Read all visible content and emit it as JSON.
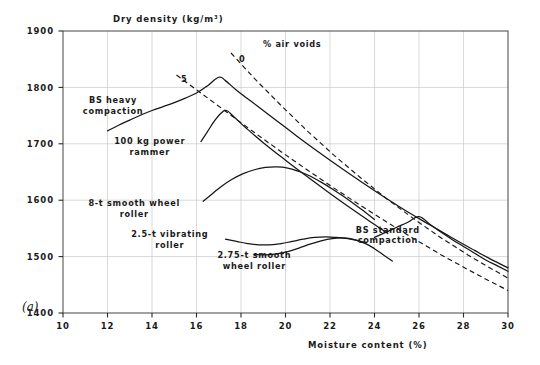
{
  "chart_data": {
    "type": "line",
    "title": "Dry density (kg/m³)",
    "panel_label": "(a)",
    "xlabel": "Moisture content (%)",
    "ylabel": "Dry density (kg/m³)",
    "xlim": [
      10,
      30
    ],
    "ylim": [
      1400,
      1900
    ],
    "xticks": [
      10,
      12,
      14,
      16,
      18,
      20,
      22,
      24,
      26,
      28,
      30
    ],
    "xtick_labels": [
      "10",
      "12",
      "14",
      "16",
      "18",
      "20",
      "22",
      "24",
      "26",
      "28",
      "30"
    ],
    "yticks": [
      1400,
      1500,
      1600,
      1700,
      1800,
      1900
    ],
    "ytick_labels": [
      "1400",
      "1500",
      "1600",
      "1700",
      "1800",
      "1900"
    ],
    "grid": true,
    "legend_position": "inline-annotations",
    "annotations": [
      {
        "name": "air-voids-title",
        "text": "% air voids",
        "x": 20.3,
        "y": 1872
      },
      {
        "name": "air-voids-0",
        "text": "0",
        "x": 18.05,
        "y": 1845
      },
      {
        "name": "air-voids-5",
        "text": "5",
        "x": 15.45,
        "y": 1810
      }
    ],
    "series": [
      {
        "name": "BS heavy compaction",
        "label": "BS heavy\ncompaction",
        "label_lines": [
          "BS heavy",
          "compaction"
        ],
        "label_x": 12.25,
        "label_y": 1772,
        "style": "solid",
        "points": [
          [
            12.0,
            1723
          ],
          [
            12.5,
            1733
          ],
          [
            13.0,
            1742
          ],
          [
            13.5,
            1751
          ],
          [
            14.0,
            1759
          ],
          [
            14.5,
            1766
          ],
          [
            15.0,
            1773
          ],
          [
            15.5,
            1781
          ],
          [
            16.0,
            1790
          ],
          [
            16.5,
            1803
          ],
          [
            17.0,
            1818
          ],
          [
            17.3,
            1812
          ],
          [
            17.8,
            1795
          ],
          [
            18.5,
            1774
          ],
          [
            19.5,
            1744
          ],
          [
            20.5,
            1714
          ],
          [
            21.5,
            1685
          ],
          [
            22.5,
            1657
          ],
          [
            23.5,
            1630
          ],
          [
            24.5,
            1604
          ],
          [
            25.5,
            1579
          ],
          [
            26.5,
            1556
          ],
          [
            27.5,
            1533
          ],
          [
            28.5,
            1511
          ],
          [
            29.2,
            1496
          ],
          [
            30.0,
            1480
          ]
        ]
      },
      {
        "name": "100 kg power rammer",
        "label": "100 kg power\nrammer",
        "label_lines": [
          "100 kg power",
          "rammer"
        ],
        "label_x": 13.9,
        "label_y": 1699,
        "style": "solid",
        "points": [
          [
            16.2,
            1704
          ],
          [
            16.5,
            1722
          ],
          [
            16.8,
            1740
          ],
          [
            17.1,
            1754
          ],
          [
            17.35,
            1759
          ],
          [
            17.7,
            1747
          ],
          [
            18.2,
            1729
          ],
          [
            19.0,
            1702
          ],
          [
            20.0,
            1671
          ],
          [
            21.0,
            1641
          ],
          [
            22.0,
            1612
          ],
          [
            23.0,
            1584
          ],
          [
            24.0,
            1557
          ],
          [
            24.6,
            1541
          ]
        ]
      },
      {
        "name": "8-t smooth wheel roller",
        "label": "8-t smooth wheel\nroller",
        "label_lines": [
          "8-t smooth wheel",
          "roller"
        ],
        "label_x": 13.2,
        "label_y": 1589,
        "style": "solid",
        "points": [
          [
            16.3,
            1598
          ],
          [
            16.7,
            1611
          ],
          [
            17.1,
            1624
          ],
          [
            17.6,
            1637
          ],
          [
            18.1,
            1647
          ],
          [
            18.6,
            1654
          ],
          [
            19.1,
            1658
          ],
          [
            19.6,
            1659
          ],
          [
            20.1,
            1657
          ],
          [
            20.6,
            1651
          ],
          [
            21.1,
            1643
          ],
          [
            21.6,
            1632
          ],
          [
            22.1,
            1620
          ],
          [
            22.6,
            1607
          ],
          [
            23.1,
            1593
          ],
          [
            23.6,
            1578
          ],
          [
            24.0,
            1566
          ]
        ]
      },
      {
        "name": "2.5-t vibrating roller",
        "label": "2.5-t vibrating\nroller",
        "label_lines": [
          "2.5-t vibrating",
          "roller"
        ],
        "label_x": 14.8,
        "label_y": 1534,
        "style": "solid",
        "points": [
          [
            17.3,
            1531
          ],
          [
            17.8,
            1527
          ],
          [
            18.3,
            1523
          ],
          [
            18.8,
            1521
          ],
          [
            19.3,
            1521
          ],
          [
            19.8,
            1523
          ],
          [
            20.3,
            1527
          ],
          [
            20.8,
            1531
          ],
          [
            21.3,
            1534
          ],
          [
            21.8,
            1535
          ],
          [
            22.3,
            1534
          ],
          [
            22.8,
            1532
          ],
          [
            23.3,
            1528
          ],
          [
            23.6,
            1525
          ]
        ]
      },
      {
        "name": "2.75-t smooth wheel roller",
        "label": "2.75-t smooth\nwheel roller",
        "label_lines": [
          "2.75-t smooth",
          "wheel roller"
        ],
        "label_x": 18.6,
        "label_y": 1497,
        "style": "solid",
        "points": [
          [
            18.6,
            1504
          ],
          [
            19.1,
            1503
          ],
          [
            19.6,
            1505
          ],
          [
            20.1,
            1509
          ],
          [
            20.6,
            1515
          ],
          [
            21.1,
            1522
          ],
          [
            21.6,
            1528
          ],
          [
            22.1,
            1532
          ],
          [
            22.6,
            1533
          ],
          [
            23.1,
            1530
          ],
          [
            23.6,
            1523
          ],
          [
            24.0,
            1514
          ],
          [
            24.4,
            1503
          ],
          [
            24.8,
            1492
          ]
        ]
      },
      {
        "name": "BS standard compaction",
        "label": "BS standard\ncompaction",
        "label_lines": [
          "BS standard",
          "compaction"
        ],
        "label_x": 24.6,
        "label_y": 1542,
        "style": "solid",
        "points": [
          [
            24.0,
            1534
          ],
          [
            24.5,
            1543
          ],
          [
            25.0,
            1552
          ],
          [
            25.5,
            1561
          ],
          [
            26.0,
            1571
          ],
          [
            26.5,
            1557
          ],
          [
            27.0,
            1543
          ],
          [
            27.5,
            1530
          ],
          [
            28.0,
            1518
          ],
          [
            28.5,
            1506
          ],
          [
            29.0,
            1494
          ],
          [
            29.5,
            1484
          ],
          [
            30.0,
            1474
          ]
        ]
      },
      {
        "name": "0% air voids line",
        "label": "0",
        "style": "dashed",
        "points": [
          [
            17.55,
            1861
          ],
          [
            18.6,
            1816
          ],
          [
            19.8,
            1768
          ],
          [
            21.0,
            1722
          ],
          [
            22.2,
            1679
          ],
          [
            23.4,
            1639
          ],
          [
            24.6,
            1601
          ],
          [
            25.8,
            1566
          ],
          [
            27.0,
            1533
          ],
          [
            28.2,
            1503
          ],
          [
            29.1,
            1482
          ],
          [
            30.0,
            1462
          ]
        ]
      },
      {
        "name": "5% air voids line",
        "label": "5",
        "style": "dashed",
        "points": [
          [
            15.1,
            1822
          ],
          [
            16.2,
            1790
          ],
          [
            17.4,
            1755
          ],
          [
            18.6,
            1720
          ],
          [
            19.8,
            1686
          ],
          [
            21.0,
            1653
          ],
          [
            22.2,
            1621
          ],
          [
            23.4,
            1590
          ],
          [
            24.6,
            1560
          ],
          [
            25.8,
            1531
          ],
          [
            27.0,
            1503
          ],
          [
            28.2,
            1477
          ],
          [
            29.1,
            1458
          ],
          [
            30.0,
            1440
          ]
        ]
      }
    ]
  },
  "figure": {
    "background_color": "#ffffff",
    "curve_color": "#161616",
    "grid_color": "#c9c9c9",
    "frame_color": "#555555",
    "text_color": "#1a1a1a"
  }
}
